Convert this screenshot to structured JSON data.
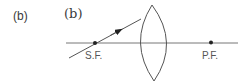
{
  "figure": {
    "outer_label": "(b)",
    "inner_label": "(b)",
    "points": [
      {
        "name": "secondary-focus",
        "label": "S.F."
      },
      {
        "name": "primary-focus",
        "label": "P.F."
      }
    ],
    "colors": {
      "line": "#555555",
      "axis": "#777777",
      "dot": "#222222",
      "text": "#3a3a3a"
    }
  }
}
